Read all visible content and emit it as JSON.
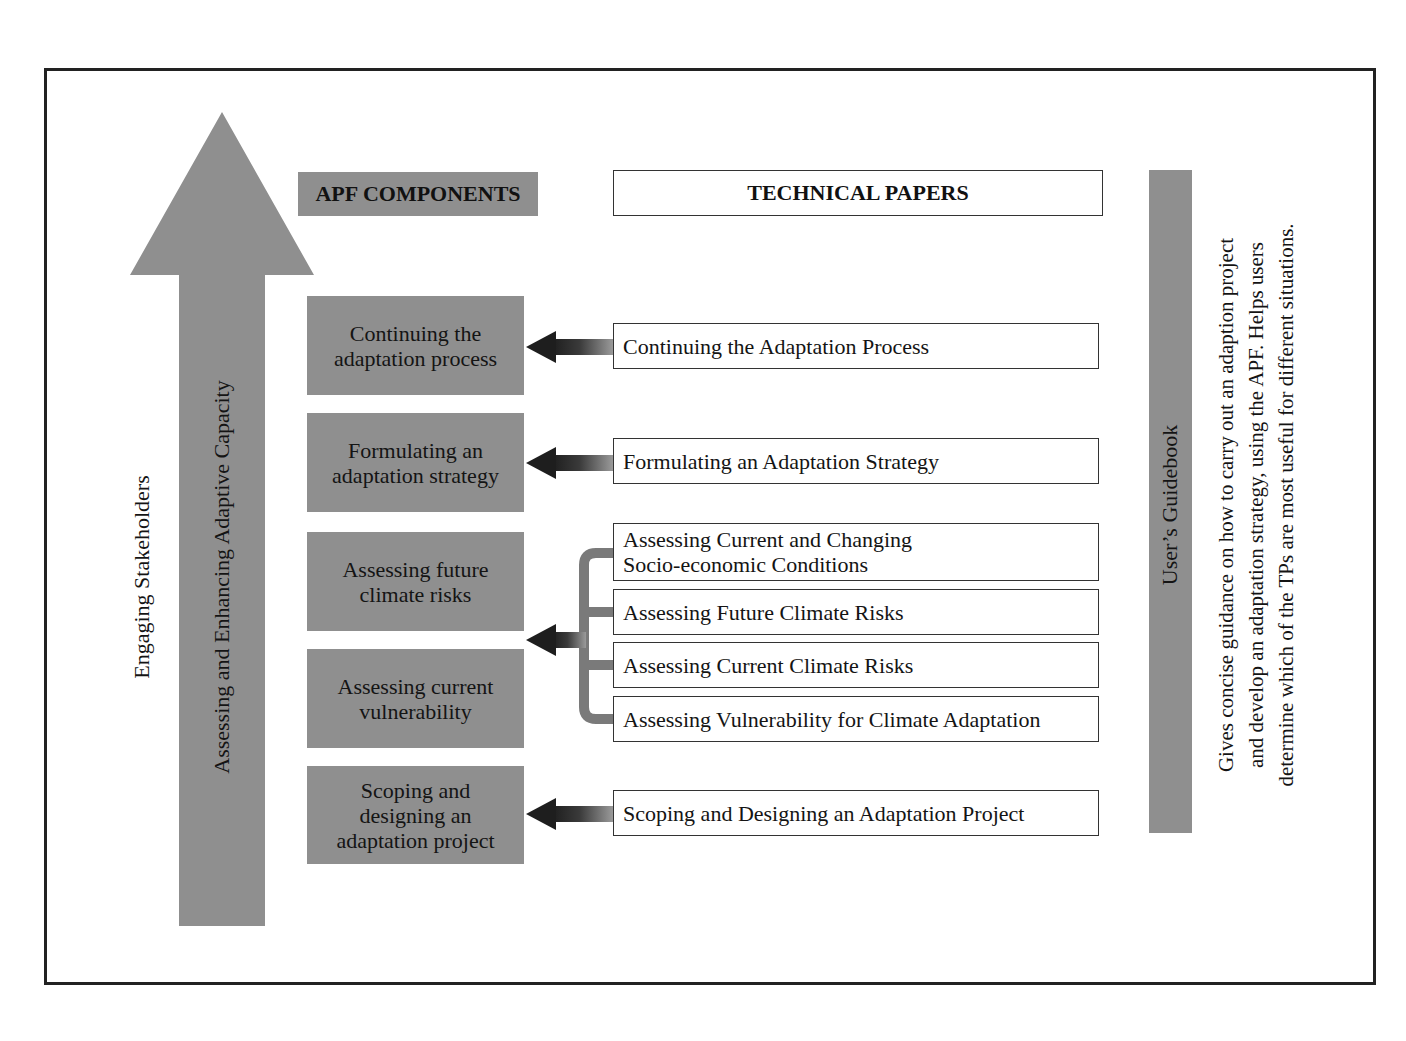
{
  "diagram": {
    "big_arrow": {
      "outer_label": "Engaging Stakeholders",
      "inner_label": "Assessing and Enhancing Adaptive Capacity",
      "color": "#8f8f8f"
    },
    "headers": {
      "components": "APF COMPONENTS",
      "technical_papers": "TECHNICAL PAPERS"
    },
    "components": [
      {
        "line1": "Continuing the",
        "line2": "adaptation process",
        "line3": ""
      },
      {
        "line1": "Formulating an",
        "line2": "adaptation strategy",
        "line3": ""
      },
      {
        "line1": "Assessing future",
        "line2": "climate risks",
        "line3": ""
      },
      {
        "line1": "Assessing current",
        "line2": "vulnerability",
        "line3": ""
      },
      {
        "line1": "Scoping and",
        "line2": "designing an",
        "line3": "adaptation project"
      }
    ],
    "technical_papers": [
      {
        "line1": "Continuing the Adaptation Process",
        "line2": ""
      },
      {
        "line1": "Formulating an Adaptation Strategy",
        "line2": ""
      },
      {
        "line1": "Assessing Current and Changing",
        "line2": "Socio-economic Conditions"
      },
      {
        "line1": "Assessing Future Climate Risks",
        "line2": ""
      },
      {
        "line1": "Assessing Current Climate Risks",
        "line2": ""
      },
      {
        "line1": "Assessing Vulnerability for Climate Adaptation",
        "line2": ""
      },
      {
        "line1": "Scoping and Designing an Adaptation Project",
        "line2": ""
      }
    ],
    "guidebook": {
      "title": "User’s Guidebook",
      "description_lines": [
        "Gives concise guidance on how to carry out an adaption project",
        "and develop an adaptation strategy, using the APF. Helps users",
        "determine which of the TPs are most useful for different situations."
      ]
    },
    "colors": {
      "box_fill": "#8f8f8f",
      "arrow_dark": "#2a2a2a",
      "frame": "#222222"
    }
  }
}
